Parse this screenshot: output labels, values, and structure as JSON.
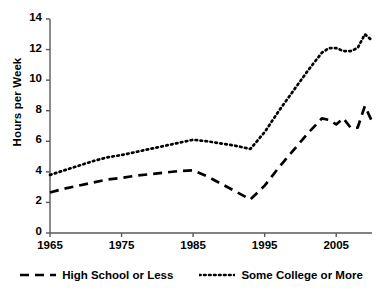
{
  "chart_data": {
    "type": "line",
    "title": "",
    "xlabel": "",
    "ylabel": "Hours per Week",
    "xlim": [
      1965,
      2010
    ],
    "ylim": [
      0,
      14
    ],
    "grid": false,
    "legend_position": "bottom",
    "xticks": [
      "1965",
      "1975",
      "1985",
      "1995",
      "2005"
    ],
    "xtick_values": [
      1965,
      1975,
      1985,
      1995,
      2005
    ],
    "yticks": [
      "0",
      "2",
      "4",
      "6",
      "8",
      "10",
      "12",
      "14"
    ],
    "ytick_values": [
      0,
      2,
      4,
      6,
      8,
      10,
      12,
      14
    ],
    "x": [
      1965,
      1967,
      1969,
      1971,
      1973,
      1975,
      1977,
      1979,
      1981,
      1983,
      1985,
      1987,
      1989,
      1991,
      1993,
      1995,
      1997,
      1999,
      2001,
      2003,
      2004,
      2005,
      2006,
      2007,
      2008,
      2009,
      2010
    ],
    "series": [
      {
        "name": "High School or Less",
        "style": "dashed",
        "color": "#000000",
        "values": [
          2.65,
          2.9,
          3.1,
          3.3,
          3.5,
          3.6,
          3.75,
          3.85,
          3.95,
          4.05,
          4.1,
          3.7,
          3.2,
          2.7,
          2.2,
          3.1,
          4.3,
          5.4,
          6.5,
          7.5,
          7.4,
          7.1,
          7.5,
          6.9,
          6.9,
          8.3,
          7.3
        ]
      },
      {
        "name": "Some College or More",
        "style": "dotted",
        "color": "#000000",
        "values": [
          3.8,
          4.1,
          4.4,
          4.7,
          4.95,
          5.1,
          5.3,
          5.5,
          5.7,
          5.9,
          6.1,
          6.0,
          5.85,
          5.7,
          5.5,
          6.6,
          8.0,
          9.3,
          10.6,
          11.8,
          12.1,
          12.1,
          11.9,
          11.9,
          12.1,
          13.0,
          12.6
        ]
      }
    ]
  },
  "legend": {
    "items": [
      {
        "label": "High School or Less",
        "style": "dashed"
      },
      {
        "label": "Some College or More",
        "style": "dotted"
      }
    ]
  }
}
